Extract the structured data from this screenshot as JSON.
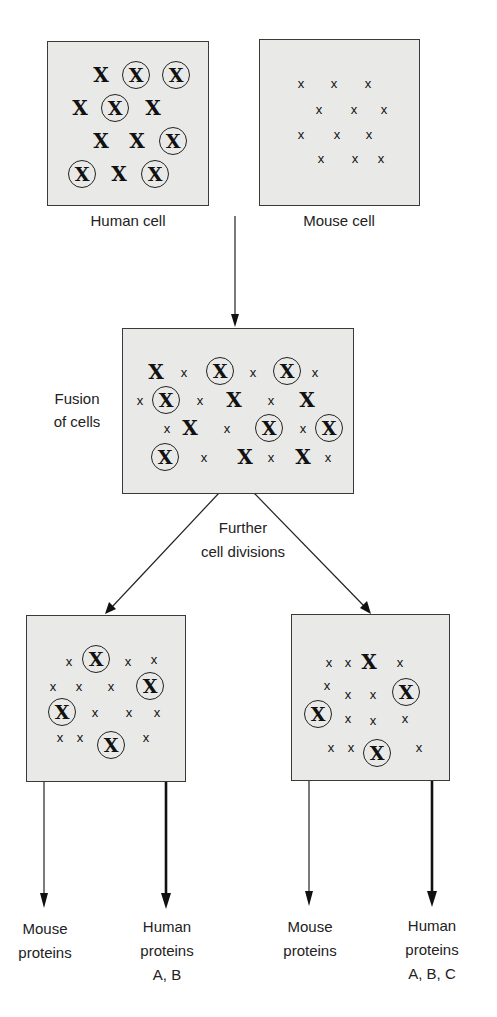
{
  "diagram": {
    "cells": {
      "human": {
        "label": "Human cell"
      },
      "mouse": {
        "label": "Mouse cell"
      },
      "hybrid": {
        "label": "Fusion of cells"
      },
      "clone_left": {},
      "clone_right": {}
    },
    "step_labels": {
      "fusion_line1": "Fusion",
      "fusion_line2": "of cells",
      "division_line1": "Further",
      "division_line2": "cell divisions"
    },
    "outputs": {
      "left_mouse": {
        "line1": "Mouse",
        "line2": "proteins"
      },
      "left_human": {
        "line1": "Human",
        "line2": "proteins",
        "line3": "A, B"
      },
      "right_mouse": {
        "line1": "Mouse",
        "line2": "proteins"
      },
      "right_human": {
        "line1": "Human",
        "line2": "proteins",
        "line3": "A, B, C"
      }
    },
    "chromosome_glyph": "X",
    "legend_semantics": {
      "big_bold_x": "human chromosome",
      "small_x": "mouse chromosome",
      "circled_x": "human chromosome (marked)"
    },
    "colors": {
      "cell_fill": "#e9e9e7",
      "outline": "#3a3a3a",
      "text": "#222222"
    }
  }
}
